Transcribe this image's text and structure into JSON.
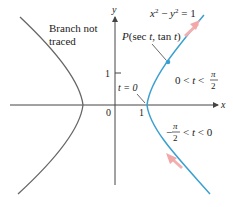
{
  "figure": {
    "equation": "x² − y² = 1",
    "point_label": "P(sec t, tan t)",
    "branch_not_traced_line1": "Branch not",
    "branch_not_traced_line2": "traced",
    "t_zero_label": "t = 0",
    "interval_upper": {
      "left": "0 < t <",
      "num": "π",
      "den": "2"
    },
    "interval_lower": {
      "sign": "−",
      "num": "π",
      "den": "2",
      "right": "< t < 0"
    },
    "axes": {
      "x_label": "x",
      "y_label": "y",
      "origin_label": "0",
      "x_tick_label": "1",
      "y_tick_label": "1"
    },
    "colors": {
      "traced_branch": "#3aa0d0",
      "untraced_branch": "#666666",
      "direction_arrow": "#f2a8a8",
      "axis": "#444444"
    }
  }
}
